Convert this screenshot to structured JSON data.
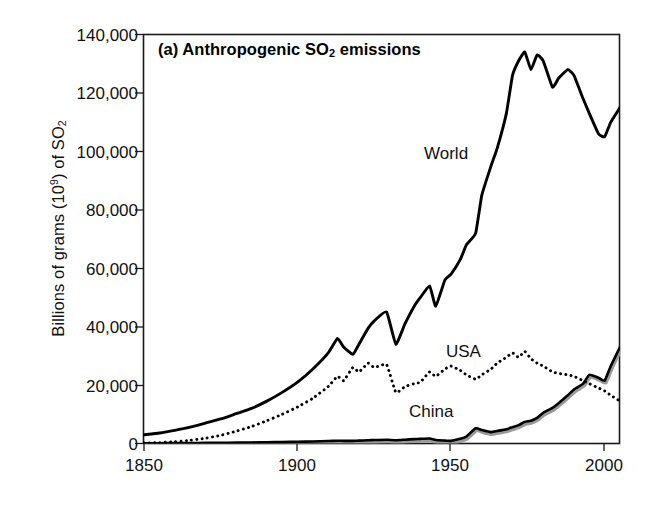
{
  "figure": {
    "panel_title_prefix": "(a) Anthropogenic SO",
    "panel_title_sub": "2",
    "panel_title_suffix": " emissions",
    "panel_title_full": "(a) Anthropogenic SO2 emissions",
    "background_color": "#ffffff",
    "axis_color": "#000000"
  },
  "axes": {
    "ylabel_part1": "Billions of grams (10",
    "ylabel_sup": "9",
    "ylabel_part2": ") of SO",
    "ylabel_sub": "2",
    "ylabel_full": "Billions of grams (10^9) of SO2",
    "xlabel": "",
    "ytick_labels": [
      "140,000",
      "120,000",
      "100,000",
      "80,000",
      "60,000",
      "40,000",
      "20,000",
      "0"
    ],
    "ytick_values": [
      140000,
      120000,
      100000,
      80000,
      60000,
      40000,
      20000,
      0
    ],
    "xtick_labels": [
      "1850",
      "1900",
      "1950",
      "2000"
    ],
    "xtick_values": [
      1850,
      1900,
      1950,
      2000
    ]
  },
  "series_labels": {
    "world": "World",
    "usa": "USA",
    "china": "China"
  },
  "chart_data": {
    "type": "line",
    "title": "(a) Anthropogenic SO2 emissions",
    "xlabel": "",
    "ylabel": "Billions of grams (10^9) of SO2",
    "xlim": [
      1850,
      2005
    ],
    "ylim": [
      0,
      140000
    ],
    "ytick_interval": 20000,
    "xtick_interval": 50,
    "grid": false,
    "legend": "inline-annotations",
    "colors": {
      "world": "#000000",
      "usa": "#000000",
      "china": "#000000",
      "china_shadow": "#9a9a9a"
    },
    "line_styles": {
      "world": "solid",
      "usa": "dotted",
      "china": "solid"
    },
    "x": [
      1850,
      1855,
      1860,
      1865,
      1870,
      1875,
      1880,
      1885,
      1890,
      1895,
      1900,
      1905,
      1910,
      1913,
      1915,
      1918,
      1920,
      1923,
      1925,
      1929,
      1932,
      1935,
      1938,
      1940,
      1943,
      1945,
      1948,
      1950,
      1953,
      1955,
      1958,
      1960,
      1963,
      1965,
      1968,
      1970,
      1972,
      1974,
      1976,
      1978,
      1980,
      1983,
      1985,
      1988,
      1990,
      1993,
      1995,
      1998,
      2000,
      2002,
      2005
    ],
    "series": [
      {
        "name": "World",
        "style": "solid",
        "values": [
          3000,
          3600,
          4500,
          5600,
          7000,
          8400,
          10200,
          12000,
          14500,
          17500,
          21000,
          25500,
          31000,
          36000,
          33000,
          30500,
          34000,
          39500,
          42000,
          45000,
          34000,
          41000,
          47000,
          50000,
          54000,
          47000,
          56000,
          58000,
          63000,
          68000,
          72000,
          85000,
          95000,
          101000,
          113000,
          126000,
          131000,
          134000,
          128000,
          133000,
          131000,
          122000,
          125000,
          128000,
          126000,
          118000,
          113000,
          106000,
          105000,
          110000,
          115000
        ]
      },
      {
        "name": "USA",
        "style": "dotted",
        "values": [
          150,
          300,
          600,
          1100,
          1800,
          2800,
          4200,
          5800,
          7800,
          10000,
          12500,
          15500,
          19500,
          23000,
          21500,
          26000,
          24500,
          27500,
          26000,
          27000,
          17500,
          19500,
          20500,
          21000,
          24500,
          23000,
          25500,
          26500,
          25000,
          23500,
          22000,
          23500,
          25500,
          27500,
          29500,
          31000,
          29500,
          31500,
          29000,
          27500,
          26500,
          24500,
          24000,
          23500,
          23000,
          21500,
          20500,
          19000,
          18000,
          16500,
          14500
        ]
      },
      {
        "name": "China",
        "style": "solid",
        "values": [
          80,
          100,
          130,
          160,
          200,
          240,
          290,
          350,
          420,
          500,
          600,
          700,
          850,
          950,
          900,
          900,
          1000,
          1100,
          1200,
          1300,
          1100,
          1300,
          1500,
          1600,
          1700,
          1200,
          1000,
          900,
          1600,
          2400,
          5200,
          4600,
          3900,
          4300,
          4900,
          5600,
          6300,
          7400,
          7800,
          8800,
          10500,
          12200,
          13800,
          16500,
          18500,
          20500,
          23500,
          22500,
          21500,
          26500,
          33000
        ]
      }
    ],
    "annotations": [
      {
        "text": "World",
        "x": 1943,
        "y": 95000
      },
      {
        "text": "USA",
        "x": 1949,
        "y": 28500
      },
      {
        "text": "China",
        "x": 1937,
        "y": 11500
      }
    ]
  }
}
